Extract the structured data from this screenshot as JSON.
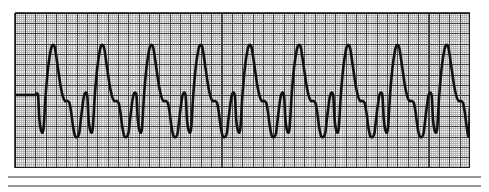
{
  "document": {
    "type": "ecg-rhythm-strip",
    "title": "ECG Rhythm Strip",
    "background_color": "#ffffff"
  },
  "grid": {
    "x": 15,
    "y": 13,
    "width": 455,
    "height": 155,
    "small_box_px": 2.07,
    "large_box_px": 10.35,
    "fine_line_color": "#9a9a9a",
    "heavy_line_color": "#3c3c3c",
    "border_color": "#1a1a1a",
    "paper_tint": "#f2f0ee",
    "show_fine_grid": true,
    "show_heavy_grid": true
  },
  "trace": {
    "color": "#111111",
    "stroke_width": 2.6,
    "baseline_y": 95,
    "peak_y": 45,
    "notch_y": 101,
    "trough_y": 137,
    "beat_period_px": 49.2,
    "first_beat_origin_px": 20,
    "beat_count": 10,
    "lead_in_flat_px": 17,
    "morphology_label": "wide-complex tachycardia",
    "beat_shape_fractions": [
      {
        "t": 0.0,
        "y_key": "baseline_y"
      },
      {
        "t": 0.06,
        "y_key": "baseline_y"
      },
      {
        "t": 0.09,
        "y": 120
      },
      {
        "t": 0.135,
        "y": 132
      },
      {
        "t": 0.175,
        "y": 128
      },
      {
        "t": 0.215,
        "y": 96
      },
      {
        "t": 0.265,
        "y": 68
      },
      {
        "t": 0.32,
        "y": 50
      },
      {
        "t": 0.36,
        "y": 45
      },
      {
        "t": 0.405,
        "y": 48
      },
      {
        "t": 0.46,
        "y": 66
      },
      {
        "t": 0.52,
        "y": 86
      },
      {
        "t": 0.57,
        "y": 97
      },
      {
        "t": 0.61,
        "y": 101
      },
      {
        "t": 0.66,
        "y": 101
      },
      {
        "t": 0.7,
        "y": 103
      },
      {
        "t": 0.735,
        "y": 112
      },
      {
        "t": 0.775,
        "y": 127
      },
      {
        "t": 0.815,
        "y": 136
      },
      {
        "t": 0.86,
        "y": 137
      },
      {
        "t": 0.9,
        "y": 133
      },
      {
        "t": 0.94,
        "y": 116
      },
      {
        "t": 1.0,
        "y": 95
      }
    ]
  },
  "footer_rules": [
    {
      "y": 177,
      "color": "#8c8c8c",
      "thickness": 1.4
    },
    {
      "y": 186,
      "color": "#8c8c8c",
      "thickness": 1.4
    }
  ]
}
